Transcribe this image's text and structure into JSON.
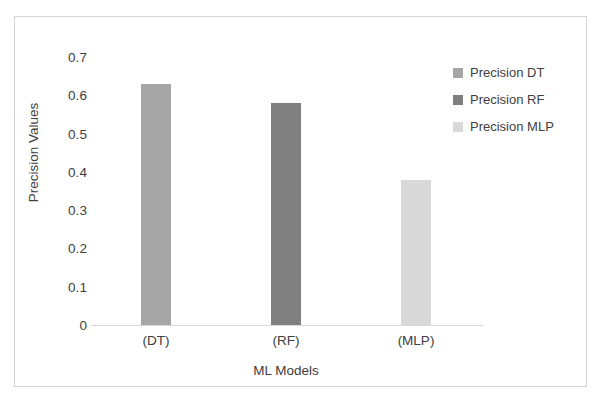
{
  "chart_data": {
    "type": "bar",
    "title": "",
    "categories": [
      "(DT)",
      "(RF)",
      "(MLP)"
    ],
    "series": [
      {
        "name": "Precision DT",
        "values": [
          0.63,
          null,
          null
        ],
        "color": "#a6a6a6"
      },
      {
        "name": "Precision RF",
        "values": [
          null,
          0.58,
          null
        ],
        "color": "#808080"
      },
      {
        "name": "Precision MLP",
        "values": [
          null,
          null,
          0.38
        ],
        "color": "#d9d9d9"
      }
    ],
    "values": [
      0.63,
      0.58,
      0.38
    ],
    "bar_colors": [
      "#a6a6a6",
      "#808080",
      "#d9d9d9"
    ],
    "xlabel": "ML Models",
    "ylabel": "Precision Values",
    "ylim": [
      0,
      0.7
    ],
    "ytick_labels": [
      "0.7",
      "0.6",
      "0.5",
      "0.4",
      "0.3",
      "0.2",
      "0.1",
      "0"
    ],
    "ytick_values": [
      0.7,
      0.6,
      0.5,
      0.4,
      0.3,
      0.2,
      0.1,
      0
    ],
    "grid": false,
    "legend_position": "right"
  },
  "legend": {
    "items": [
      {
        "label": "Precision DT",
        "color": "#a6a6a6"
      },
      {
        "label": "Precision RF",
        "color": "#808080"
      },
      {
        "label": "Precision MLP",
        "color": "#d9d9d9"
      }
    ]
  },
  "axes": {
    "y_title": "Precision Values",
    "x_title": "ML Models"
  },
  "colors": {
    "frame_border": "#d4d4d4",
    "axis_line": "#d9d9d9",
    "text": "#404040",
    "background": "#ffffff"
  }
}
